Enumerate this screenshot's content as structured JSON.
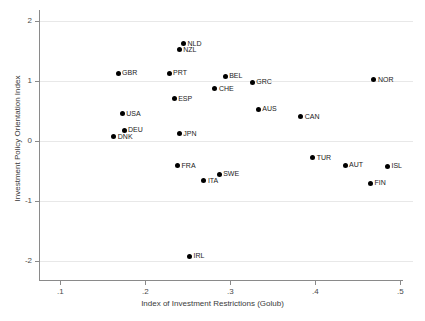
{
  "chart_data": {
    "type": "scatter",
    "title": "",
    "xlabel": "Index of Investment Restrictions (Golub)",
    "ylabel": "Investment Policy Orientation Index",
    "xlim": [
      0.075,
      0.515
    ],
    "ylim": [
      -2.28,
      2.18
    ],
    "xticks": [
      0.1,
      0.2,
      0.3,
      0.4,
      0.5
    ],
    "xtick_labels": [
      ".1",
      ".2",
      ".3",
      ".4",
      ".5"
    ],
    "yticks": [
      2,
      1,
      0,
      -1,
      -2
    ],
    "ytick_labels": [
      "2",
      "1",
      "0",
      "-1",
      "-2"
    ],
    "grid": "horizontal",
    "legend": "none",
    "marker_color": "#000000",
    "gridline_color": "#e8e8e8",
    "axis_color": "#8a8a8a",
    "points": [
      {
        "label": "NLD",
        "x": 0.245,
        "y": 1.62,
        "label_side": "right"
      },
      {
        "label": "NZL",
        "x": 0.24,
        "y": 1.52,
        "label_side": "right"
      },
      {
        "label": "GBR",
        "x": 0.168,
        "y": 1.13,
        "label_side": "right"
      },
      {
        "label": "PRT",
        "x": 0.228,
        "y": 1.13,
        "label_side": "right"
      },
      {
        "label": "BEL",
        "x": 0.294,
        "y": 1.08,
        "label_side": "right"
      },
      {
        "label": "NOR",
        "x": 0.469,
        "y": 1.02,
        "label_side": "right"
      },
      {
        "label": "GRC",
        "x": 0.326,
        "y": 0.98,
        "label_side": "right"
      },
      {
        "label": "CHE",
        "x": 0.282,
        "y": 0.87,
        "label_side": "right"
      },
      {
        "label": "ESP",
        "x": 0.234,
        "y": 0.7,
        "label_side": "right"
      },
      {
        "label": "AUS",
        "x": 0.333,
        "y": 0.53,
        "label_side": "right"
      },
      {
        "label": "USA",
        "x": 0.173,
        "y": 0.45,
        "label_side": "right"
      },
      {
        "label": "CAN",
        "x": 0.383,
        "y": 0.4,
        "label_side": "right"
      },
      {
        "label": "DEU",
        "x": 0.175,
        "y": 0.18,
        "label_side": "right"
      },
      {
        "label": "JPN",
        "x": 0.24,
        "y": 0.12,
        "label_side": "right"
      },
      {
        "label": "DNK",
        "x": 0.163,
        "y": 0.07,
        "label_side": "right"
      },
      {
        "label": "TUR",
        "x": 0.397,
        "y": -0.28,
        "label_side": "right"
      },
      {
        "label": "AUT",
        "x": 0.435,
        "y": -0.4,
        "label_side": "right"
      },
      {
        "label": "FRA",
        "x": 0.238,
        "y": -0.41,
        "label_side": "right"
      },
      {
        "label": "ISL",
        "x": 0.485,
        "y": -0.42,
        "label_side": "right"
      },
      {
        "label": "SWE",
        "x": 0.287,
        "y": -0.55,
        "label_side": "right"
      },
      {
        "label": "ITA",
        "x": 0.269,
        "y": -0.66,
        "label_side": "right"
      },
      {
        "label": "FIN",
        "x": 0.465,
        "y": -0.7,
        "label_side": "right"
      },
      {
        "label": "IRL",
        "x": 0.252,
        "y": -1.92,
        "label_side": "right"
      }
    ]
  }
}
